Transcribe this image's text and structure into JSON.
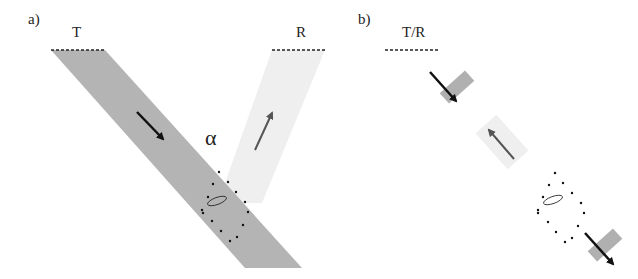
{
  "panel_a": {
    "label": "a)",
    "transmitter_label": "T",
    "receiver_label": "R",
    "angle_label": "α"
  },
  "panel_b": {
    "label": "b)",
    "transceiver_label": "T/R"
  },
  "colors": {
    "incident_beam": "#b4b4b4",
    "reflected_beam": "#efefef",
    "pulse_block": "#b0b0b0",
    "arrow_dark": "#111111",
    "arrow_gray": "#555555"
  }
}
